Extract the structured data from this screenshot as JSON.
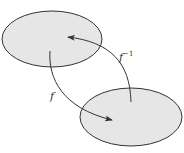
{
  "diagram": {
    "type": "function-mapping",
    "sets": [
      {
        "id": "domain",
        "description": "upper-left ellipse",
        "fill": "#e6e6e6",
        "stroke": "#333333"
      },
      {
        "id": "codomain",
        "description": "lower-right ellipse",
        "fill": "#e6e6e6",
        "stroke": "#333333"
      }
    ],
    "arrows": [
      {
        "from": "domain",
        "to": "codomain",
        "label": "f"
      },
      {
        "from": "codomain",
        "to": "domain",
        "label": "f",
        "superscript": "−1"
      }
    ]
  },
  "labels": {
    "f": "f",
    "f_inverse_base": "f",
    "f_inverse_sup": "−1"
  },
  "colors": {
    "set_fill": "#e6e6e6",
    "stroke": "#333333",
    "background": "#ffffff"
  }
}
